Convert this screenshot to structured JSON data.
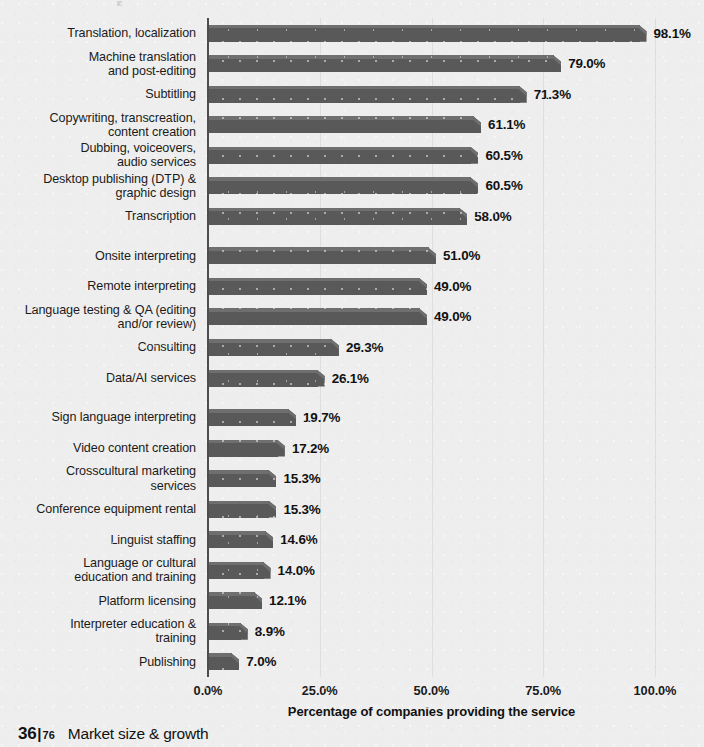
{
  "footer": {
    "page_current": "36",
    "page_separator": "|",
    "page_total": "76",
    "section": "Market size & growth"
  },
  "chart_data": {
    "type": "bar",
    "orientation": "horizontal",
    "title": "",
    "xlabel": "Percentage of companies providing the service",
    "ylabel": "",
    "xlim": [
      0,
      100
    ],
    "xticks": [
      0,
      25,
      50,
      75,
      100
    ],
    "xtick_labels": [
      "0.0%",
      "25.0%",
      "50.0%",
      "75.0%",
      "100.0%"
    ],
    "grid": true,
    "grid_axis": "x",
    "legend": false,
    "bar_color": "#59595a",
    "bar_top_color": "#6f6f70",
    "background_color": "#eeeeee",
    "value_label_format": "0.0%",
    "categories": [
      "Translation, localization",
      "Machine translation\nand post-editing",
      "Subtitling",
      "Copywriting, transcreation,\ncontent creation",
      "Dubbing, voiceovers,\naudio services",
      "Desktop publishing (DTP) &\ngraphic design",
      "Transcription",
      "Onsite interpreting",
      "Remote interpreting",
      "Language testing & QA (editing\nand/or review)",
      "Consulting",
      "Data/AI services",
      "Sign language interpreting",
      "Video content creation",
      "Crosscultural marketing\nservices",
      "Conference equipment rental",
      "Linguist staffing",
      "Language or cultural\neducation and training",
      "Platform licensing",
      "Interpreter education &\ntraining",
      "Publishing"
    ],
    "values": [
      98.1,
      79.0,
      71.3,
      61.1,
      60.5,
      60.5,
      58.0,
      51.0,
      49.0,
      49.0,
      29.3,
      26.1,
      19.7,
      17.2,
      15.3,
      15.3,
      14.6,
      14.0,
      12.1,
      8.9,
      7.0
    ],
    "value_labels": [
      "98.1%",
      "79.0%",
      "71.3%",
      "61.1%",
      "60.5%",
      "60.5%",
      "58.0%",
      "51.0%",
      "49.0%",
      "49.0%",
      "29.3%",
      "26.1%",
      "19.7%",
      "17.2%",
      "15.3%",
      "15.3%",
      "14.6%",
      "14.0%",
      "12.1%",
      "8.9%",
      "7.0%"
    ],
    "group_breaks_after": [
      6,
      11
    ]
  }
}
